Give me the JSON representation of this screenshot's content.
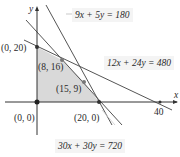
{
  "axes": {
    "x_label": "x",
    "y_label": "y",
    "x_tick": "40"
  },
  "vertices": [
    {
      "label": "(0, 20)",
      "x": 0,
      "y": 20
    },
    {
      "label": "(8, 16)",
      "x": 8,
      "y": 16
    },
    {
      "label": "(15, 9)",
      "x": 15,
      "y": 9
    },
    {
      "label": "(20, 0)",
      "x": 20,
      "y": 0
    },
    {
      "label": "(0, 0)",
      "x": 0,
      "y": 0
    }
  ],
  "constraints": [
    {
      "label": "9x + 5y = 180"
    },
    {
      "label": "12x + 24y = 480"
    },
    {
      "label": "30x + 30y = 720"
    }
  ],
  "colors": {
    "feasible_region": "#d9d9d9",
    "lines": "#555555",
    "label_box": "#f4f4f4"
  }
}
